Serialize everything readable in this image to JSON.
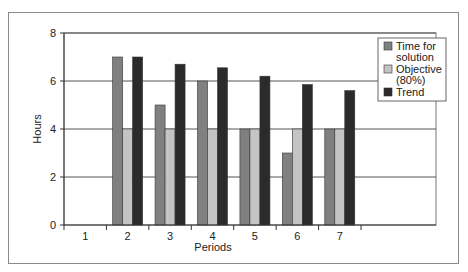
{
  "chart_data": {
    "type": "bar",
    "title": "",
    "xlabel": "Periods",
    "ylabel": "Hours",
    "ylim": [
      0,
      8
    ],
    "yticks": [
      0,
      2,
      4,
      6,
      8
    ],
    "grid": true,
    "legend_position": "right-top",
    "categories": [
      "1",
      "2",
      "3",
      "4",
      "5",
      "6",
      "7"
    ],
    "series": [
      {
        "name": "Time for solution",
        "color": "#808080",
        "values": [
          null,
          7,
          5,
          6,
          4,
          3,
          4
        ]
      },
      {
        "name": "Objective (80%)",
        "color": "#c4c4c4",
        "values": [
          null,
          4,
          4,
          4,
          4,
          4,
          4
        ]
      },
      {
        "name": "Trend",
        "color": "#2b2b2b",
        "values": [
          null,
          7,
          6.7,
          6.55,
          6.2,
          5.85,
          5.6
        ]
      }
    ]
  },
  "legend": {
    "items": [
      {
        "lines": [
          "Time for",
          "solution"
        ],
        "color": "#808080"
      },
      {
        "lines": [
          "Objective",
          "(80%)"
        ],
        "color": "#c4c4c4"
      },
      {
        "lines": [
          "Trend"
        ],
        "color": "#2b2b2b"
      }
    ]
  }
}
